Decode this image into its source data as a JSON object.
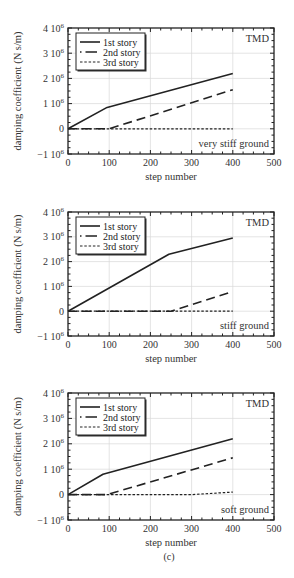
{
  "figure": {
    "ylabel": "damping coefficient (N s/m)",
    "xlabel": "step number",
    "legend": [
      "1st story",
      "2nd story",
      "3rd story"
    ],
    "corner_label": "TMD",
    "x_ticks": [
      "0",
      "100",
      "200",
      "300",
      "400",
      "500"
    ],
    "y_ticks": [
      {
        "base": "4 10",
        "exp": "6"
      },
      {
        "base": "3 10",
        "exp": "6"
      },
      {
        "base": "2 10",
        "exp": "6"
      },
      {
        "base": "1 10",
        "exp": "6"
      },
      {
        "base": "0",
        "exp": ""
      },
      {
        "base": "−1 10",
        "exp": "6"
      }
    ],
    "line_color": "#222222",
    "grid_color": "#d8d8d8"
  },
  "panels": [
    {
      "caption": "(a)",
      "ground": "very stiff ground"
    },
    {
      "caption": "(b)",
      "ground": "stiff ground"
    },
    {
      "caption": "(c)",
      "ground": "soft ground"
    }
  ],
  "chart_data": [
    {
      "type": "line",
      "title": "(a) very stiff ground",
      "annotation": "TMD",
      "xlabel": "step number",
      "ylabel": "damping coefficient (N s/m)",
      "xlim": [
        0,
        500
      ],
      "ylim": [
        -1000000,
        4000000
      ],
      "x_ticks": [
        0,
        100,
        200,
        300,
        400,
        500
      ],
      "y_ticks": [
        -1000000,
        0,
        1000000,
        2000000,
        3000000,
        4000000
      ],
      "grid": true,
      "legend_position": "upper left",
      "series": [
        {
          "name": "1st story",
          "style": "solid",
          "points": [
            [
              0,
              0
            ],
            [
              95,
              850000
            ],
            [
              400,
              2200000
            ]
          ]
        },
        {
          "name": "2nd story",
          "style": "dashed",
          "points": [
            [
              0,
              0
            ],
            [
              100,
              0
            ],
            [
              400,
              1550000
            ]
          ]
        },
        {
          "name": "3rd story",
          "style": "dotted",
          "points": [
            [
              0,
              0
            ],
            [
              400,
              0
            ]
          ]
        }
      ]
    },
    {
      "type": "line",
      "title": "(b) stiff ground",
      "annotation": "TMD",
      "xlabel": "step number",
      "ylabel": "damping coefficient (N s/m)",
      "xlim": [
        0,
        500
      ],
      "ylim": [
        -1000000,
        4000000
      ],
      "x_ticks": [
        0,
        100,
        200,
        300,
        400,
        500
      ],
      "y_ticks": [
        -1000000,
        0,
        1000000,
        2000000,
        3000000,
        4000000
      ],
      "grid": true,
      "legend_position": "upper left",
      "series": [
        {
          "name": "1st story",
          "style": "solid",
          "points": [
            [
              0,
              0
            ],
            [
              245,
              2300000
            ],
            [
              400,
              2950000
            ]
          ]
        },
        {
          "name": "2nd story",
          "style": "dashed",
          "points": [
            [
              0,
              0
            ],
            [
              250,
              0
            ],
            [
              400,
              800000
            ]
          ]
        },
        {
          "name": "3rd story",
          "style": "dotted",
          "points": [
            [
              0,
              0
            ],
            [
              400,
              0
            ]
          ]
        }
      ]
    },
    {
      "type": "line",
      "title": "(c) soft ground",
      "annotation": "TMD",
      "xlabel": "step number",
      "ylabel": "damping coefficient (N s/m)",
      "xlim": [
        0,
        500
      ],
      "ylim": [
        -1000000,
        4000000
      ],
      "x_ticks": [
        0,
        100,
        200,
        300,
        400,
        500
      ],
      "y_ticks": [
        -1000000,
        0,
        1000000,
        2000000,
        3000000,
        4000000
      ],
      "grid": true,
      "legend_position": "upper left",
      "series": [
        {
          "name": "1st story",
          "style": "solid",
          "points": [
            [
              0,
              0
            ],
            [
              85,
              800000
            ],
            [
              400,
              2200000
            ]
          ]
        },
        {
          "name": "2nd story",
          "style": "dashed",
          "points": [
            [
              0,
              0
            ],
            [
              95,
              0
            ],
            [
              400,
              1450000
            ]
          ]
        },
        {
          "name": "3rd story",
          "style": "dotted",
          "points": [
            [
              0,
              0
            ],
            [
              300,
              0
            ],
            [
              400,
              100000
            ]
          ]
        }
      ]
    }
  ]
}
